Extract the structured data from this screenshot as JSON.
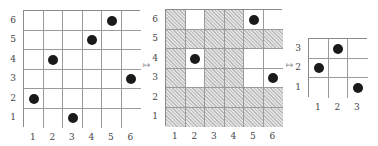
{
  "diagram": {
    "cell_size": 19.5,
    "panels": [
      {
        "id": "original",
        "size": 6,
        "left": 23,
        "top": 10,
        "x_labels": [
          "1",
          "2",
          "3",
          "4",
          "5",
          "6"
        ],
        "y_labels": [
          "1",
          "2",
          "3",
          "4",
          "5",
          "6"
        ],
        "points": [
          [
            1,
            2
          ],
          [
            2,
            4
          ],
          [
            3,
            1
          ],
          [
            4,
            5
          ],
          [
            5,
            6
          ],
          [
            6,
            3
          ]
        ],
        "highlight_cols": [],
        "highlight_rows": []
      },
      {
        "id": "selected",
        "size": 6,
        "left": 165,
        "top": 9,
        "x_labels": [
          "1",
          "2",
          "3",
          "4",
          "5",
          "6"
        ],
        "y_labels": [
          "1",
          "2",
          "3",
          "4",
          "5",
          "6"
        ],
        "points": [
          [
            2,
            4
          ],
          [
            5,
            6
          ],
          [
            6,
            3
          ]
        ],
        "highlight_cols": [
          2,
          5,
          6
        ],
        "highlight_rows": [
          3,
          4,
          6
        ]
      },
      {
        "id": "pattern",
        "size": 3,
        "left": 308,
        "top": 38,
        "x_labels": [
          "1",
          "2",
          "3"
        ],
        "y_labels": [
          "1",
          "2",
          "3"
        ],
        "points": [
          [
            1,
            2
          ],
          [
            2,
            3
          ],
          [
            3,
            1
          ]
        ],
        "highlight_cols": [],
        "highlight_rows": []
      }
    ],
    "arrows": [
      {
        "symbol": "↦",
        "left": 143,
        "top": 60
      },
      {
        "symbol": "↦",
        "left": 286,
        "top": 60
      }
    ],
    "colors": {
      "dot": "#1a1a1a",
      "grid": "#9a9a9a",
      "hatch": "#d6d6d6"
    }
  }
}
